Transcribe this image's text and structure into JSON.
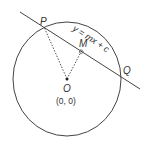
{
  "labels": {
    "P": "P",
    "Q": "Q",
    "M": "M",
    "O": "O",
    "origin": "(0, 0)",
    "line_eq": "y = mx + c"
  },
  "colors": {
    "stroke": "#444444",
    "text": "#333333"
  }
}
